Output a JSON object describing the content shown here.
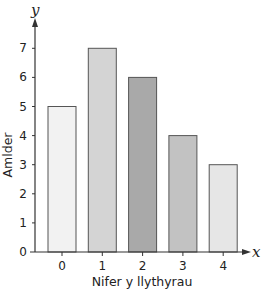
{
  "chart_data": {
    "type": "bar",
    "title": "",
    "categories": [
      "0",
      "1",
      "2",
      "3",
      "4"
    ],
    "values": [
      5,
      7,
      6,
      4,
      3
    ],
    "xlabel": "Nifer y llythyrau",
    "ylabel": "Amlder",
    "x_axis_variable": "x",
    "y_axis_variable": "y",
    "ylim": [
      0,
      7.5
    ],
    "yticks": [
      "0",
      "1",
      "2",
      "3",
      "4",
      "5",
      "6",
      "7"
    ],
    "grid": false,
    "legend": null,
    "bar_colors": [
      "#f2f2f2",
      "#d4d4d4",
      "#a9a9a9",
      "#c2c2c2",
      "#e6e6e6"
    ],
    "bar_edge_color": "#555555"
  }
}
